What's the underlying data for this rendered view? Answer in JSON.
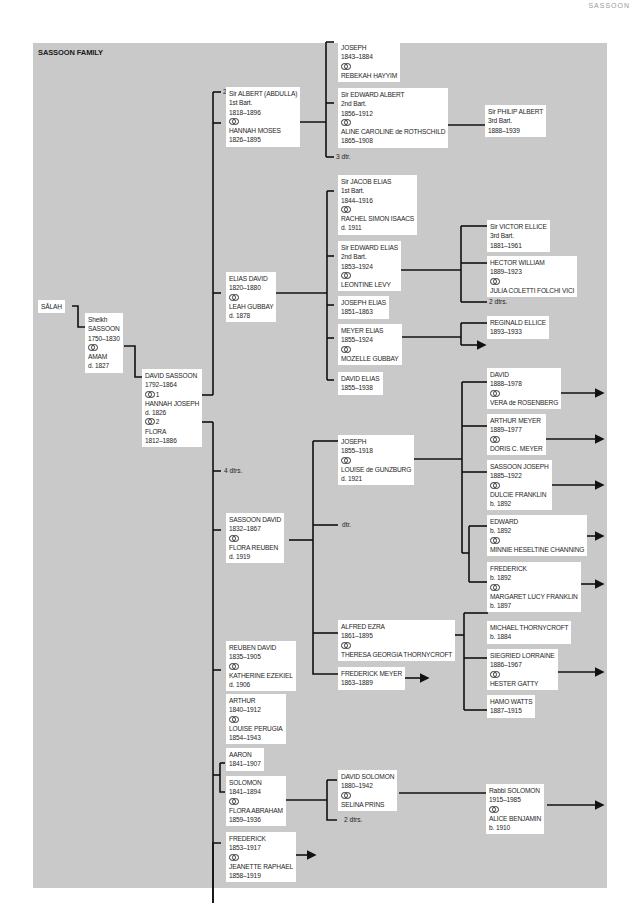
{
  "running_head": "SASSOON",
  "title": "SASSOON FAMILY",
  "colors": {
    "panel": "#c9c9c9",
    "box": "#ffffff",
    "line": "#111111",
    "text": "#1e1e1e"
  },
  "marriage_symbol": "marriage-rings-icon",
  "people": {
    "salah": {
      "lines": [
        "SĀLAḤ"
      ]
    },
    "sheikh": {
      "lines": [
        "Sheikh",
        "SASSOON",
        "1750–1830",
        "@",
        "AMAM",
        "d. 1827"
      ]
    },
    "david_sassoon": {
      "lines": [
        "DAVID SASSOON",
        "1792–1864",
        "@ 1",
        "HANNAH JOSEPH",
        "d. 1826",
        "@ 2",
        "FLORA",
        "1812–1886"
      ]
    },
    "albert": {
      "lines": [
        "Sir ALBERT (ABDULLA)",
        "1st Bart.",
        "1818–1896",
        "@",
        "HANNAH MOSES",
        "1826–1895"
      ]
    },
    "joseph_1843": {
      "lines": [
        "JOSEPH",
        "1843–1884",
        "@",
        "REBEKAH ḤAYYIM"
      ]
    },
    "edward_albert": {
      "lines": [
        "Sir EDWARD ALBERT",
        "2nd Bart.",
        "1856–1912",
        "@",
        "ALINE CAROLINE de ROTHSCHILD",
        "1865–1908"
      ]
    },
    "philip": {
      "lines": [
        "Sir PHILIP ALBERT",
        "3rd Bart.",
        "1888–1939"
      ]
    },
    "elias_david": {
      "lines": [
        "ELIAS DAVID",
        "1820–1880",
        "@",
        "LEAH GUBBAY",
        "d. 1878"
      ]
    },
    "jacob_elias": {
      "lines": [
        "Sir JACOB ELIAS",
        "1st Bart.",
        "1844–1916",
        "@",
        "RACHEL SIMON ISAACS",
        "d. 1911"
      ]
    },
    "edward_elias": {
      "lines": [
        "Sir EDWARD ELIAS",
        "2nd Bart.",
        "1853–1924",
        "@",
        "LEONTINE LEVY"
      ]
    },
    "victor": {
      "lines": [
        "Sir VICTOR ELLICE",
        "3rd Bart.",
        "1881–1961"
      ]
    },
    "hector": {
      "lines": [
        "HECTOR WILLIAM",
        "1889–1923",
        "@",
        "JULIA COLETTI FOLCHI VICI"
      ]
    },
    "joseph_elias": {
      "lines": [
        "JOSEPH ELIAS",
        "1851–1863"
      ]
    },
    "meyer_elias": {
      "lines": [
        "MEYER ELIAS",
        "1855–1924",
        "@",
        "MOZELLE GUBBAY"
      ]
    },
    "reginald": {
      "lines": [
        "REGINALD ELLICE",
        "1893–1933"
      ]
    },
    "david_elias": {
      "lines": [
        "DAVID ELIAS",
        "1855–1938"
      ]
    },
    "sassoon_david": {
      "lines": [
        "SASSOON DAVID",
        "1832–1867",
        "@",
        "FLORA REUBEN",
        "d. 1919"
      ]
    },
    "joseph_1855": {
      "lines": [
        "JOSEPH",
        "1855–1918",
        "@",
        "LOUISE de GUNZBURG",
        "d. 1921"
      ]
    },
    "david_1888": {
      "lines": [
        "DAVID",
        "1888–1978",
        "@",
        "VERA de ROSENBERG"
      ]
    },
    "arthur_meyer": {
      "lines": [
        "ARTHUR MEYER",
        "1889–1977",
        "@",
        "DORIS C. MEYER"
      ]
    },
    "sassoon_joseph": {
      "lines": [
        "SASSOON JOSEPH",
        "1885–1922",
        "@",
        "DULCIE FRANKLIN",
        "b. 1892"
      ]
    },
    "edward_1892": {
      "lines": [
        "EDWARD",
        "b. 1892",
        "@",
        "MINNIE HESELTINE CHANNING"
      ]
    },
    "frederick_1892": {
      "lines": [
        "FREDERICK",
        "b. 1892",
        "@",
        "MARGARET LUCY FRANKLIN",
        "b. 1897"
      ]
    },
    "alfred_ezra": {
      "lines": [
        "ALFRED EZRA",
        "1861–1895",
        "@",
        "THERESA GEORGIA THORNYCROFT"
      ]
    },
    "michael": {
      "lines": [
        "MICHAEL THORNYCROFT",
        "b. 1884"
      ]
    },
    "siegfried": {
      "lines": [
        "SIEGRIED LORRAINE",
        "1886–1967",
        "@",
        "HESTER GATTY"
      ]
    },
    "hamo": {
      "lines": [
        "HAMO WATTS",
        "1887–1915"
      ]
    },
    "frederick_meyer": {
      "lines": [
        "FREDERICK MEYER",
        "1863–1889"
      ]
    },
    "reuben": {
      "lines": [
        "REUBEN DAVID",
        "1835–1905",
        "@",
        "KATHERINE EZEKIEL",
        "d. 1906"
      ]
    },
    "arthur": {
      "lines": [
        "ARTHUR",
        "1840–1912",
        "@",
        "LOUISE PERUGIA",
        "1854–1943"
      ]
    },
    "aaron": {
      "lines": [
        "AARON",
        "1841–1907"
      ]
    },
    "solomon": {
      "lines": [
        "SOLOMON",
        "1841–1894",
        "@",
        "FLORA ABRAHAM",
        "1859–1936"
      ]
    },
    "david_solomon": {
      "lines": [
        "DAVID SOLOMON",
        "1880–1942",
        "@",
        "SELINA PRINS"
      ]
    },
    "rabbi_solomon": {
      "lines": [
        "Rabbi SOLOMON",
        "1915–1985",
        "@",
        "ALICE BENJAMIN",
        "b. 1910"
      ]
    },
    "frederick_1853": {
      "lines": [
        "FREDERICK",
        "1853–1917",
        "@",
        "JEANETTE RAPHAEL",
        "1858–1919"
      ]
    }
  },
  "notes": {
    "two_dtrs_top": "2 dtrs.",
    "three_dtr": "3 dtr.",
    "two_dtrs_ellice": "2 dtrs.",
    "four_dtrs": "4 dtrs.",
    "dtr": "dtr.",
    "two_dtrs_solomon": "2 dtrs."
  }
}
